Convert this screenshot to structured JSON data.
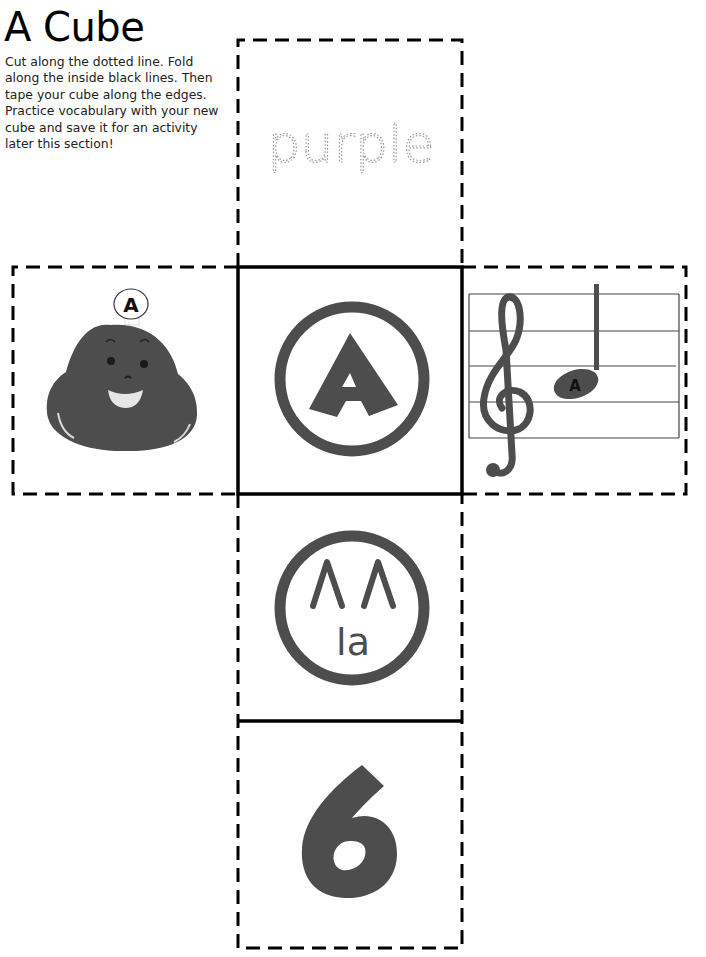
{
  "page": {
    "title": "A Cube",
    "instructions": "Cut along the dotted line. Fold along the inside black lines. Then tape your cube along the edges. Practice vocabulary with your new cube and save it for an activity later this section!"
  },
  "colors": {
    "figure": "#4d4d4d",
    "line": "#000000",
    "traced_text": "#9a9a9a",
    "background": "#ffffff"
  },
  "cube_faces": {
    "top": {
      "type": "traced-word",
      "word": "purple"
    },
    "left": {
      "type": "character",
      "description": "smiling bean character with badge",
      "badge_letter": "A"
    },
    "center": {
      "type": "circled-letter",
      "letter": "A"
    },
    "right": {
      "type": "music-staff",
      "clef": "treble-clef",
      "note_label": "A"
    },
    "below_center": {
      "type": "solfege-hand-sign",
      "symbol": "ΛΛ",
      "syllable": "la"
    },
    "bottom": {
      "type": "number",
      "value": "6"
    }
  }
}
